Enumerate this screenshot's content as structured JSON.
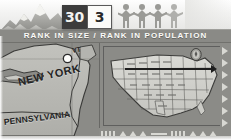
{
  "page": {
    "kind": "almanac-state-fact-panel",
    "subject": "New York"
  },
  "header": {
    "title": "RANK IN SIZE / RANK IN POPULATION",
    "bar_color": "#8a8a86",
    "text_color": "#fbfbf8"
  },
  "badges": {
    "rank_in_size": {
      "value": "30",
      "icon": "mountains-icon",
      "bg": "#3c3c3c",
      "fg": "#f2f2f0"
    },
    "rank_in_population": {
      "value": "3",
      "icon": "people-icon",
      "bg": "#fbfbf9",
      "fg": "#2a2a2a"
    }
  },
  "icons": {
    "mountains": "mountains-icon",
    "people": "people-holding-hands-icon",
    "state_seal": "state-seal-icon",
    "pointer": "pointer-arrow-icon"
  },
  "left_map": {
    "name": "new-york-region-map",
    "labels": [
      {
        "text": "NEW YORK",
        "x": 18,
        "y": 33,
        "size": 11,
        "rotate": -13
      },
      {
        "text": "PENNSYLVANIA",
        "x": 4,
        "y": 74,
        "size": 9,
        "rotate": -7
      },
      {
        "text": "VT",
        "x": 72,
        "y": 4,
        "size": 7,
        "rotate": -10
      }
    ],
    "city_marker": {
      "name": "capital-city-dot",
      "x": 64,
      "y": 12
    },
    "land_color": "#b9b9b4",
    "water_color": "#8b8b87"
  },
  "inset_map": {
    "name": "united-states-locator-map",
    "pointer_label": "pointer-to-new-york",
    "frame_color": "#3c3c3c",
    "land_color": "#d2d2cd",
    "background": "#8b8b87",
    "border_pattern": "triangle-dash-border"
  },
  "colors": {
    "paper": "#f3f3f2",
    "map_bg": "#8f8f8b",
    "ink": "#232323"
  }
}
